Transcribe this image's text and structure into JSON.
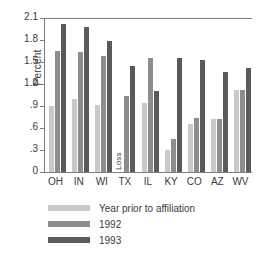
{
  "chart_data": {
    "type": "bar",
    "title": "",
    "xlabel": "",
    "ylabel": "Percent",
    "ylim": [
      0,
      2.1
    ],
    "yticks": [
      "0",
      ".3",
      ".6",
      ".9",
      "1.2",
      "1.5",
      "1.8",
      "2.1"
    ],
    "ytick_values": [
      0,
      0.3,
      0.6,
      0.9,
      1.2,
      1.5,
      1.8,
      2.1
    ],
    "grid": false,
    "legend_position": "below-left",
    "categories": [
      "OH",
      "IN",
      "WI",
      "TX",
      "IL",
      "KY",
      "CO",
      "AZ",
      "WV"
    ],
    "series": [
      {
        "name": "Year prior to affiliation",
        "color": "#c9c9c9",
        "values": [
          0.9,
          1.0,
          0.91,
          null,
          0.94,
          0.3,
          0.66,
          0.72,
          1.12
        ]
      },
      {
        "name": "1992",
        "color": "#8d8d8d",
        "values": [
          1.65,
          1.63,
          1.58,
          1.03,
          1.55,
          0.45,
          0.74,
          0.72,
          1.12
        ]
      },
      {
        "name": "1993",
        "color": "#5a5a5a",
        "values": [
          2.02,
          1.98,
          1.79,
          1.45,
          1.1,
          1.56,
          1.53,
          1.36,
          1.42
        ]
      }
    ],
    "annotations": [
      {
        "text": "Loss",
        "category": "TX",
        "series": "Year prior to affiliation",
        "rotation": 90
      }
    ]
  }
}
